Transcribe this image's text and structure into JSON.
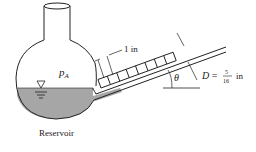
{
  "diagram": {
    "reservoir_label": "Reservoir",
    "pressure_label": "p",
    "pressure_subscript": "A",
    "scale_label": "1 in",
    "angle_label": "θ",
    "diameter_label": "D =",
    "diameter_numerator": "5",
    "diameter_denominator": "16",
    "diameter_unit": "in",
    "colors": {
      "line": "#222222",
      "liquid": "#a6a6a6",
      "background": "#ffffff"
    }
  }
}
